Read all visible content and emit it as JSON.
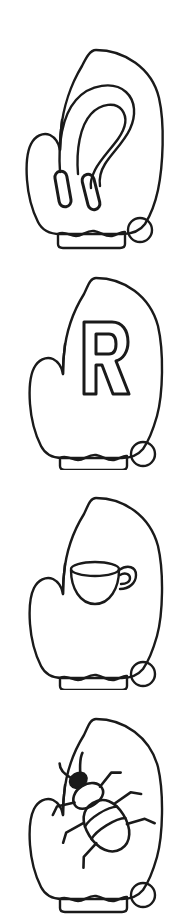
{
  "document": {
    "title": "Mitten Coloring Pages",
    "page_width": 183,
    "page_height": 920,
    "background_color": "#ffffff",
    "line_color": "#1a1a1a",
    "style": "black-and-white line-art coloring page",
    "panel_count": 4
  },
  "panels": [
    {
      "index": 1,
      "name": "mitten-with-bobby-pin",
      "label": "Mitten with bobby pin",
      "motif": "bobby-pin",
      "motif_label": "Bobby pin",
      "top": 40,
      "height": 210,
      "has_cuff": true,
      "cuff_label": "Ribbed cuff",
      "has_pompom": true,
      "pompom_label": "Pompom circle",
      "thumb_side": "left"
    },
    {
      "index": 2,
      "name": "mitten-with-letter-r",
      "label": "Mitten with letter R",
      "motif": "letter",
      "motif_label": "Letter R",
      "letter": "R",
      "top": 270,
      "height": 200,
      "has_cuff": true,
      "cuff_label": "Ribbed cuff",
      "has_pompom": true,
      "pompom_label": "Pompom circle",
      "thumb_side": "left"
    },
    {
      "index": 3,
      "name": "mitten-with-teacup",
      "label": "Mitten with teacup",
      "motif": "teacup",
      "motif_label": "Teacup",
      "top": 490,
      "height": 200,
      "has_cuff": true,
      "cuff_label": "Ribbed cuff",
      "has_pompom": true,
      "pompom_label": "Pompom circle",
      "thumb_side": "left"
    },
    {
      "index": 4,
      "name": "mitten-with-beetle",
      "label": "Mitten with beetle",
      "motif": "beetle",
      "motif_label": "Beetle",
      "top": 705,
      "height": 210,
      "has_cuff": true,
      "cuff_label": "Ribbed cuff",
      "has_pompom": true,
      "pompom_label": "Pompom circle",
      "thumb_side": "left"
    }
  ],
  "colors": {
    "ink": "#1a1a1a",
    "paper": "#ffffff"
  }
}
